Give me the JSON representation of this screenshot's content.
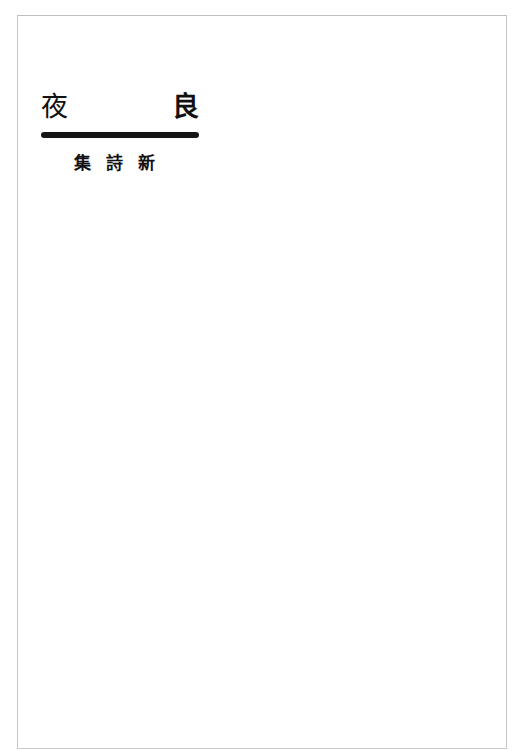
{
  "page": {
    "title": {
      "left_char": "夜",
      "right_char": "良"
    },
    "subtitle": "集詩新",
    "colors": {
      "ink": "#111111",
      "frame": "#c8c8c8",
      "paper": "#ffffff"
    }
  }
}
